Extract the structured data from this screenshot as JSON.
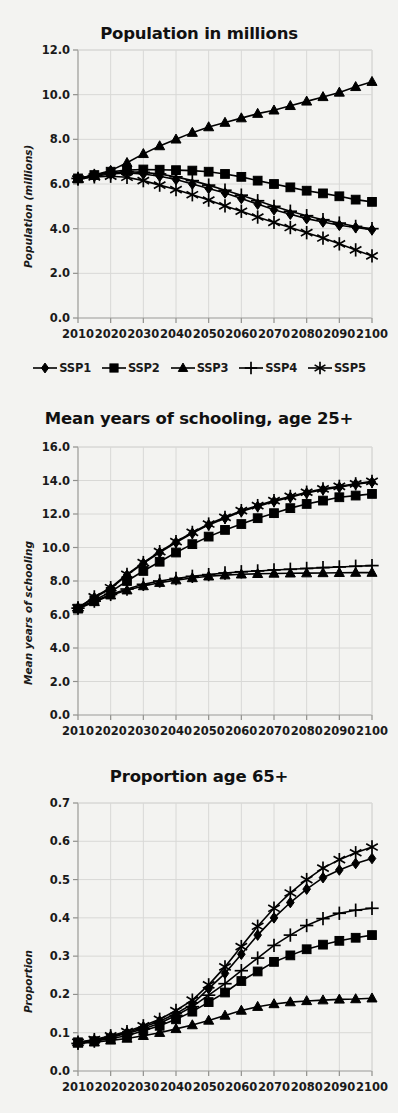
{
  "figure": {
    "background_color": "#f3f3f1",
    "ink_color": "#000000",
    "grid_color": "#d8d8d6"
  },
  "legend": {
    "position": "below-first-panel",
    "items": [
      {
        "label": "SSP1",
        "marker": "diamond"
      },
      {
        "label": "SSP2",
        "marker": "square"
      },
      {
        "label": "SSP3",
        "marker": "triangle"
      },
      {
        "label": "SSP4",
        "marker": "plus"
      },
      {
        "label": "SSP5",
        "marker": "asterisk"
      }
    ]
  },
  "chart_data": [
    {
      "type": "line",
      "title": "Population in millions",
      "xlabel": "",
      "ylabel": "Population (millions)",
      "x": [
        2010,
        2015,
        2020,
        2025,
        2030,
        2035,
        2040,
        2045,
        2050,
        2055,
        2060,
        2065,
        2070,
        2075,
        2080,
        2085,
        2090,
        2095,
        2100
      ],
      "xticks": [
        "2010",
        "2020",
        "2030",
        "2040",
        "2050",
        "2060",
        "2070",
        "2080",
        "2090",
        "2100"
      ],
      "yticks": [
        "0.0",
        "2.0",
        "4.0",
        "6.0",
        "8.0",
        "10.0",
        "12.0"
      ],
      "ylim": [
        0.0,
        12.0
      ],
      "xlim": [
        2010,
        2100
      ],
      "grid": true,
      "legend_position": "below",
      "series": [
        {
          "name": "SSP1",
          "marker": "diamond",
          "values": [
            6.25,
            6.35,
            6.45,
            6.5,
            6.45,
            6.35,
            6.2,
            6.0,
            5.8,
            5.6,
            5.35,
            5.1,
            4.85,
            4.65,
            4.45,
            4.3,
            4.15,
            4.05,
            3.95
          ]
        },
        {
          "name": "SSP2",
          "marker": "square",
          "values": [
            6.25,
            6.4,
            6.55,
            6.62,
            6.65,
            6.64,
            6.62,
            6.6,
            6.55,
            6.45,
            6.32,
            6.15,
            6.0,
            5.85,
            5.7,
            5.58,
            5.45,
            5.3,
            5.2
          ]
        },
        {
          "name": "SSP3",
          "marker": "triangle",
          "values": [
            6.25,
            6.4,
            6.6,
            6.95,
            7.35,
            7.7,
            8.0,
            8.3,
            8.55,
            8.75,
            8.95,
            9.15,
            9.3,
            9.5,
            9.7,
            9.9,
            10.1,
            10.35,
            10.58
          ]
        },
        {
          "name": "SSP4",
          "marker": "plus",
          "values": [
            6.25,
            6.38,
            6.5,
            6.55,
            6.52,
            6.45,
            6.32,
            6.15,
            5.95,
            5.72,
            5.5,
            5.25,
            5.0,
            4.78,
            4.58,
            4.4,
            4.25,
            4.1,
            4.0
          ]
        },
        {
          "name": "SSP5",
          "marker": "asterisk",
          "values": [
            6.22,
            6.32,
            6.35,
            6.3,
            6.15,
            5.95,
            5.75,
            5.52,
            5.28,
            5.02,
            4.78,
            4.52,
            4.28,
            4.05,
            3.82,
            3.58,
            3.32,
            3.05,
            2.78
          ]
        }
      ]
    },
    {
      "type": "line",
      "title": "Mean years of schooling, age 25+",
      "xlabel": "",
      "ylabel": "Mean years of schooling",
      "x": [
        2010,
        2015,
        2020,
        2025,
        2030,
        2035,
        2040,
        2045,
        2050,
        2055,
        2060,
        2065,
        2070,
        2075,
        2080,
        2085,
        2090,
        2095,
        2100
      ],
      "xticks": [
        "2010",
        "2020",
        "2030",
        "2040",
        "2050",
        "2060",
        "2070",
        "2080",
        "2090",
        "2100"
      ],
      "yticks": [
        "0.0",
        "2.0",
        "4.0",
        "6.0",
        "8.0",
        "10.0",
        "12.0",
        "14.0",
        "16.0"
      ],
      "ylim": [
        0.0,
        16.0
      ],
      "xlim": [
        2010,
        2100
      ],
      "grid": true,
      "legend_position": "shared-with-first-panel",
      "series": [
        {
          "name": "SSP1",
          "marker": "diamond",
          "values": [
            6.4,
            7.0,
            7.55,
            8.35,
            9.05,
            9.7,
            10.3,
            10.85,
            11.35,
            11.75,
            12.15,
            12.45,
            12.75,
            13.0,
            13.25,
            13.45,
            13.6,
            13.78,
            13.9
          ]
        },
        {
          "name": "SSP2",
          "marker": "square",
          "values": [
            6.35,
            6.85,
            7.35,
            8.0,
            8.6,
            9.15,
            9.7,
            10.2,
            10.65,
            11.05,
            11.4,
            11.75,
            12.05,
            12.35,
            12.6,
            12.8,
            13.0,
            13.1,
            13.2
          ]
        },
        {
          "name": "SSP3",
          "marker": "triangle",
          "values": [
            6.35,
            6.75,
            7.15,
            7.45,
            7.7,
            7.9,
            8.05,
            8.18,
            8.28,
            8.35,
            8.4,
            8.43,
            8.45,
            8.46,
            8.47,
            8.48,
            8.49,
            8.5,
            8.5
          ]
        },
        {
          "name": "SSP4",
          "marker": "plus",
          "values": [
            6.38,
            6.8,
            7.2,
            7.52,
            7.8,
            8.0,
            8.15,
            8.28,
            8.38,
            8.48,
            8.55,
            8.6,
            8.66,
            8.7,
            8.75,
            8.8,
            8.84,
            8.88,
            8.92
          ]
        },
        {
          "name": "SSP5",
          "marker": "asterisk",
          "values": [
            6.4,
            7.05,
            7.6,
            8.4,
            9.1,
            9.75,
            10.35,
            10.9,
            11.4,
            11.8,
            12.2,
            12.5,
            12.8,
            13.05,
            13.3,
            13.5,
            13.65,
            13.8,
            13.95
          ]
        }
      ]
    },
    {
      "type": "line",
      "title": "Proportion age 65+",
      "xlabel": "",
      "ylabel": "Proportion",
      "x": [
        2010,
        2015,
        2020,
        2025,
        2030,
        2035,
        2040,
        2045,
        2050,
        2055,
        2060,
        2065,
        2070,
        2075,
        2080,
        2085,
        2090,
        2095,
        2100
      ],
      "xticks": [
        "2010",
        "2020",
        "2030",
        "2040",
        "2050",
        "2060",
        "2070",
        "2080",
        "2090",
        "2100"
      ],
      "yticks": [
        "0.0",
        "0.1",
        "0.2",
        "0.3",
        "0.4",
        "0.5",
        "0.6",
        "0.7"
      ],
      "ylim": [
        0.0,
        0.7
      ],
      "xlim": [
        2010,
        2100
      ],
      "grid": true,
      "legend_position": "shared-with-first-panel",
      "series": [
        {
          "name": "SSP1",
          "marker": "diamond",
          "values": [
            0.075,
            0.08,
            0.09,
            0.1,
            0.115,
            0.13,
            0.15,
            0.175,
            0.215,
            0.255,
            0.305,
            0.355,
            0.4,
            0.44,
            0.475,
            0.505,
            0.525,
            0.542,
            0.555
          ]
        },
        {
          "name": "SSP2",
          "marker": "square",
          "values": [
            0.075,
            0.078,
            0.085,
            0.092,
            0.105,
            0.118,
            0.135,
            0.155,
            0.18,
            0.205,
            0.235,
            0.26,
            0.285,
            0.302,
            0.318,
            0.33,
            0.34,
            0.348,
            0.355
          ]
        },
        {
          "name": "SSP3",
          "marker": "triangle",
          "values": [
            0.072,
            0.075,
            0.08,
            0.085,
            0.092,
            0.1,
            0.11,
            0.12,
            0.132,
            0.145,
            0.158,
            0.168,
            0.175,
            0.18,
            0.183,
            0.185,
            0.187,
            0.188,
            0.19
          ]
        },
        {
          "name": "SSP4",
          "marker": "plus",
          "values": [
            0.072,
            0.078,
            0.088,
            0.098,
            0.11,
            0.125,
            0.145,
            0.168,
            0.198,
            0.228,
            0.262,
            0.295,
            0.328,
            0.355,
            0.38,
            0.398,
            0.412,
            0.42,
            0.425
          ]
        },
        {
          "name": "SSP5",
          "marker": "asterisk",
          "values": [
            0.075,
            0.082,
            0.092,
            0.103,
            0.118,
            0.135,
            0.158,
            0.185,
            0.225,
            0.272,
            0.325,
            0.378,
            0.425,
            0.465,
            0.5,
            0.53,
            0.552,
            0.57,
            0.585
          ]
        }
      ]
    }
  ]
}
